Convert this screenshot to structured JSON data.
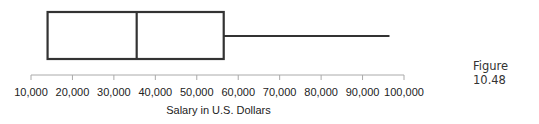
{
  "caption": "Figure 10.48",
  "chart_data": {
    "type": "boxplot",
    "title": "",
    "xlabel": "Salary in U.S. Dollars",
    "ylabel": "",
    "orientation": "horizontal",
    "xlim": [
      10000,
      100000
    ],
    "ticks": [
      10000,
      20000,
      30000,
      40000,
      50000,
      60000,
      70000,
      80000,
      90000,
      100000
    ],
    "tick_labels": [
      "10,000",
      "20,000",
      "30,000",
      "40,000",
      "50,000",
      "60,000",
      "70,000",
      "80,000",
      "90,000",
      "100,000"
    ],
    "box": {
      "min": 14000,
      "q1": 14000,
      "median": 35500,
      "q3": 56500,
      "max": 96500
    },
    "grid": false,
    "legend": null
  }
}
